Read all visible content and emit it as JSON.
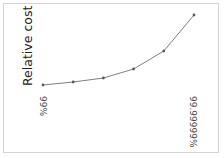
{
  "chart_data": {
    "type": "line",
    "title": "",
    "xlabel": "",
    "ylabel": "Relative cost",
    "categories": [
      "99%",
      "99.9%",
      "99.99%",
      "99.999%",
      "99.9999%",
      "99.99999%"
    ],
    "tick_labels": [
      "99%",
      "99.99999%"
    ],
    "series": [
      {
        "name": "Relative cost",
        "values": [
          0,
          3,
          7,
          16,
          34,
          70
        ]
      }
    ],
    "ylim": [
      0,
      70
    ],
    "grid": false,
    "legend": "none",
    "line_color": "#7f7f7f",
    "marker_color": "#595959"
  }
}
